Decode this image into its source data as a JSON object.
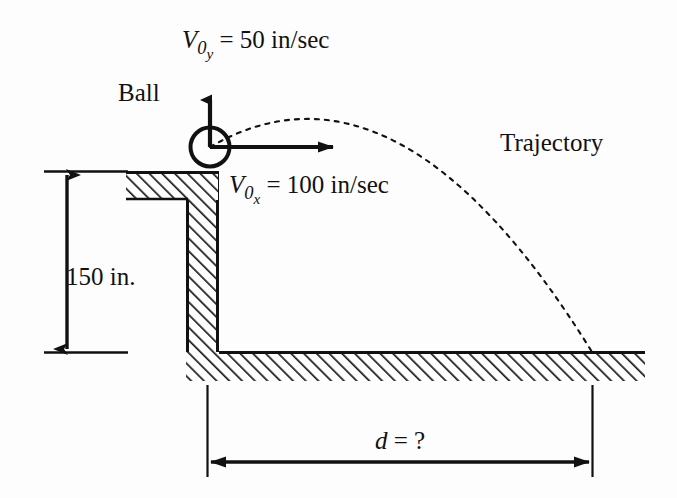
{
  "figure": {
    "labels": {
      "ball": "Ball",
      "trajectory": "Trajectory",
      "height": "150 in.",
      "distance_symbol": "d",
      "distance_value": "= ?",
      "vy_symbol": "V",
      "vy_subscript": "0",
      "vy_subscript2": "y",
      "vy_value": "= 50 in/sec",
      "vx_symbol": "V",
      "vx_subscript": "0",
      "vx_subscript2": "x",
      "vx_value": "= 100 in/sec"
    },
    "quantities": {
      "initial_velocity_y": "50 in/sec",
      "initial_velocity_x": "100 in/sec",
      "ledge_height": "150 in.",
      "horizontal_distance": "?"
    },
    "colors": {
      "ink": "#111111",
      "background": "#ffffff",
      "hatch": "#1a1a1a"
    }
  }
}
